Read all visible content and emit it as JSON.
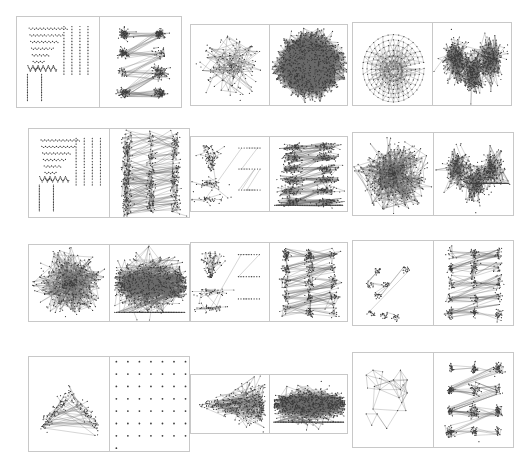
{
  "figure": {
    "title": "",
    "background": "#ffffff",
    "border_color": "#c8c8c8",
    "node_color": "#3a3a3a",
    "edge_color": "#6b6b6b",
    "grid_rows": 4,
    "grid_cols": 3,
    "side_marker": "⌐"
  },
  "chart_data": {
    "type": "scatter",
    "title": "",
    "xlabel": "",
    "ylabel": "",
    "legend": [],
    "grid": false,
    "cells": [
      {
        "id": "cell-r1c1",
        "row": 1,
        "col": 1,
        "x": 16,
        "y": 16,
        "w": 166,
        "h": 92,
        "left": {
          "name": "triangular-lattice-layout",
          "style": "lattice",
          "nodes": 120,
          "seed": 11,
          "density": 0.35,
          "spread": [
            0.1,
            0.92,
            0.08,
            0.95
          ]
        },
        "right": {
          "name": "cluster-blobs-2x4",
          "style": "blobs",
          "blob_rows": 4,
          "blob_cols": 2,
          "nodes": 460,
          "seed": 23,
          "density": 0.9,
          "spread": [
            0.08,
            0.95,
            0.08,
            0.95
          ]
        }
      },
      {
        "id": "cell-r1c2",
        "row": 1,
        "col": 2,
        "x": 190,
        "y": 24,
        "w": 158,
        "h": 82,
        "left": {
          "name": "sparse-web-layout",
          "style": "web",
          "nodes": 150,
          "seed": 31,
          "density": 0.55,
          "spread": [
            0.1,
            0.95,
            0.12,
            0.92
          ]
        },
        "right": {
          "name": "dense-hairball-layout",
          "style": "hairball",
          "nodes": 900,
          "seed": 37,
          "density": 1.0,
          "spread": [
            0.08,
            0.95,
            0.08,
            0.92
          ]
        }
      },
      {
        "id": "cell-r1c3",
        "row": 1,
        "col": 3,
        "x": 352,
        "y": 22,
        "w": 160,
        "h": 84,
        "left": {
          "name": "nested-diamond-mesh",
          "style": "mesh",
          "nodes": 180,
          "seed": 43,
          "density": 0.6,
          "spread": [
            0.08,
            0.95,
            0.1,
            0.95
          ]
        },
        "right": {
          "name": "butterfly-cluster-layout",
          "style": "butterfly",
          "nodes": 820,
          "seed": 53,
          "density": 0.95,
          "spread": [
            0.06,
            0.96,
            0.08,
            0.95
          ]
        }
      },
      {
        "id": "cell-r2c1",
        "row": 2,
        "col": 1,
        "x": 28,
        "y": 128,
        "w": 162,
        "h": 90,
        "left": {
          "name": "triangular-lattice-layout",
          "style": "lattice",
          "nodes": 130,
          "seed": 61,
          "density": 0.4,
          "spread": [
            0.1,
            0.95,
            0.08,
            0.95
          ]
        },
        "right": {
          "name": "cluster-blobs-grid",
          "style": "blobgrid",
          "blob_rows": 6,
          "blob_cols": 3,
          "nodes": 520,
          "seed": 67,
          "density": 0.85,
          "spread": [
            0.06,
            0.97,
            0.06,
            0.96
          ]
        }
      },
      {
        "id": "cell-r2c2",
        "row": 2,
        "col": 2,
        "x": 190,
        "y": 136,
        "w": 158,
        "h": 76,
        "left": {
          "name": "funnel-tree-layout",
          "style": "funnel",
          "nodes": 170,
          "seed": 71,
          "density": 0.5,
          "spread": [
            0.06,
            0.96,
            0.08,
            0.94
          ]
        },
        "right": {
          "name": "stacked-band-clusters",
          "style": "bands",
          "blob_rows": 6,
          "blob_cols": 2,
          "nodes": 640,
          "seed": 79,
          "density": 0.95,
          "spread": [
            0.06,
            0.96,
            0.06,
            0.95
          ]
        }
      },
      {
        "id": "cell-r2c3",
        "row": 2,
        "col": 3,
        "x": 352,
        "y": 132,
        "w": 162,
        "h": 84,
        "left": {
          "name": "dense-web-layout",
          "style": "web",
          "nodes": 420,
          "seed": 83,
          "density": 0.95,
          "spread": [
            0.08,
            0.94,
            0.08,
            0.94
          ]
        },
        "right": {
          "name": "bipolar-cluster-layout",
          "style": "bipolar",
          "nodes": 560,
          "seed": 89,
          "density": 0.9,
          "spread": [
            0.06,
            0.96,
            0.08,
            0.94
          ]
        }
      },
      {
        "id": "cell-r3c1",
        "row": 3,
        "col": 1,
        "x": 28,
        "y": 244,
        "w": 162,
        "h": 78,
        "left": {
          "name": "radial-burst-layout",
          "style": "burst",
          "nodes": 380,
          "seed": 97,
          "density": 0.9,
          "spread": [
            0.08,
            0.94,
            0.06,
            0.96
          ]
        },
        "right": {
          "name": "horizontal-band-layout",
          "style": "hband",
          "nodes": 620,
          "seed": 101,
          "density": 0.95,
          "spread": [
            0.06,
            0.96,
            0.1,
            0.92
          ]
        }
      },
      {
        "id": "cell-r3c2",
        "row": 3,
        "col": 2,
        "x": 190,
        "y": 242,
        "w": 158,
        "h": 80,
        "left": {
          "name": "funnel-tree-layout",
          "style": "funnel",
          "nodes": 160,
          "seed": 103,
          "density": 0.45,
          "spread": [
            0.06,
            0.95,
            0.08,
            0.94
          ]
        },
        "right": {
          "name": "matrix-cluster-layout",
          "style": "blobgrid",
          "blob_rows": 5,
          "blob_cols": 3,
          "nodes": 520,
          "seed": 107,
          "density": 0.9,
          "spread": [
            0.05,
            0.97,
            0.06,
            0.96
          ]
        }
      },
      {
        "id": "cell-r3c3",
        "row": 3,
        "col": 3,
        "x": 352,
        "y": 240,
        "w": 162,
        "h": 86,
        "left": {
          "name": "fan-cone-layout",
          "style": "fan",
          "nodes": 140,
          "seed": 109,
          "density": 0.7,
          "spread": [
            0.08,
            0.92,
            0.08,
            0.94
          ]
        },
        "right": {
          "name": "floret-cluster-layout",
          "style": "florets",
          "blob_rows": 5,
          "blob_cols": 3,
          "nodes": 380,
          "seed": 113,
          "density": 0.8,
          "spread": [
            0.06,
            0.96,
            0.06,
            0.95
          ]
        }
      },
      {
        "id": "cell-r4c1",
        "row": 4,
        "col": 1,
        "x": 28,
        "y": 356,
        "w": 162,
        "h": 96,
        "left": {
          "name": "tent-mesh-layout",
          "style": "tent",
          "nodes": 160,
          "seed": 127,
          "density": 0.6,
          "spread": [
            0.08,
            0.94,
            0.3,
            0.72
          ]
        },
        "right": {
          "name": "regular-dot-grid",
          "style": "dotgrid",
          "grid_cols": 7,
          "grid_rows": 8,
          "nodes": 57,
          "seed": 131,
          "density": 0.1,
          "spread": [
            0.08,
            0.95,
            0.05,
            0.97
          ]
        }
      },
      {
        "id": "cell-r4c2",
        "row": 4,
        "col": 2,
        "x": 190,
        "y": 374,
        "w": 158,
        "h": 60,
        "left": {
          "name": "comet-tail-layout",
          "style": "comet",
          "nodes": 340,
          "seed": 137,
          "density": 0.85,
          "spread": [
            0.05,
            0.96,
            0.15,
            0.88
          ]
        },
        "right": {
          "name": "dense-horizontal-band",
          "style": "hband",
          "nodes": 700,
          "seed": 139,
          "density": 1.0,
          "spread": [
            0.05,
            0.97,
            0.18,
            0.84
          ]
        }
      },
      {
        "id": "cell-r4c3",
        "row": 4,
        "col": 3,
        "x": 352,
        "y": 352,
        "w": 162,
        "h": 96,
        "left": {
          "name": "sparse-polygon-layout",
          "style": "polygons",
          "nodes": 46,
          "seed": 149,
          "density": 0.25,
          "spread": [
            0.08,
            0.94,
            0.08,
            0.94
          ]
        },
        "right": {
          "name": "chain-cluster-layout",
          "style": "chains",
          "blob_rows": 4,
          "blob_cols": 3,
          "nodes": 420,
          "seed": 151,
          "density": 0.85,
          "spread": [
            0.06,
            0.96,
            0.06,
            0.95
          ]
        }
      }
    ]
  }
}
